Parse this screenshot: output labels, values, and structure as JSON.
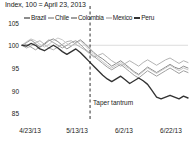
{
  "chart_data": {
    "type": "line",
    "title": "Index, 100 = April 23, 2013",
    "xlabel": "",
    "ylabel": "",
    "ylim": [
      84,
      106
    ],
    "yticks": [
      105,
      100,
      95,
      90,
      85
    ],
    "xticks": [
      "4/23/13",
      "5/13/13",
      "6/2/13",
      "6/22/13"
    ],
    "xlim": [
      "4/23/13",
      "7/2/13"
    ],
    "grid": "horizontal-single-at-100",
    "legend_position": "top",
    "annotations": [
      {
        "label": "Taper tantrum",
        "x": "5/22/13",
        "style": "dashed-vertical-line"
      }
    ],
    "series": [
      {
        "name": "Brazil",
        "color": "#8c8c8c",
        "values": [
          100.0,
          100.6,
          101.2,
          100.4,
          99.6,
          100.2,
          101.0,
          101.4,
          100.8,
          100.0,
          99.2,
          99.8,
          100.6,
          101.2,
          100.4,
          99.4,
          98.4,
          97.6,
          97.0,
          96.2,
          95.4,
          96.0,
          96.6,
          95.8,
          95.0,
          94.2,
          93.6,
          94.4,
          95.2,
          94.6,
          94.0,
          94.6,
          95.2,
          95.8,
          95.2,
          94.8,
          95.4,
          95.0
        ]
      },
      {
        "name": "Chile",
        "color": "#b3b3b3",
        "values": [
          100.0,
          99.4,
          99.8,
          100.6,
          101.0,
          100.2,
          99.4,
          99.0,
          99.6,
          100.2,
          100.8,
          101.0,
          100.2,
          99.6,
          99.0,
          98.2,
          97.4,
          97.8,
          98.2,
          97.4,
          96.6,
          96.0,
          95.4,
          96.0,
          96.6,
          96.0,
          95.4,
          96.2,
          96.8,
          96.2,
          95.6,
          96.2,
          96.8,
          97.2,
          96.6,
          96.0,
          96.6,
          96.2
        ]
      },
      {
        "name": "Colombia",
        "color": "#a0a0a0",
        "values": [
          100.0,
          100.2,
          99.6,
          99.0,
          99.6,
          100.4,
          101.2,
          100.6,
          100.0,
          99.4,
          100.0,
          100.6,
          101.0,
          100.2,
          99.2,
          98.4,
          97.6,
          96.8,
          96.0,
          95.2,
          94.6,
          95.2,
          95.8,
          95.0,
          94.2,
          93.4,
          92.8,
          93.6,
          94.4,
          93.8,
          93.2,
          93.8,
          94.4,
          95.0,
          94.4,
          93.8,
          94.4,
          94.0
        ]
      },
      {
        "name": "Mexico",
        "color": "#c8c8c8",
        "values": [
          100.0,
          100.8,
          101.4,
          101.0,
          100.2,
          99.6,
          100.2,
          101.0,
          101.6,
          101.2,
          100.4,
          99.8,
          100.4,
          101.0,
          100.0,
          99.0,
          98.0,
          97.2,
          96.4,
          95.6,
          95.0,
          95.6,
          96.2,
          95.4,
          94.8,
          94.0,
          93.4,
          94.2,
          95.0,
          94.4,
          93.8,
          94.4,
          95.0,
          95.6,
          95.0,
          94.4,
          95.0,
          94.6
        ]
      },
      {
        "name": "Peru",
        "color": "#333333",
        "values": [
          100.0,
          99.8,
          100.4,
          100.0,
          99.2,
          98.8,
          99.4,
          100.0,
          99.4,
          98.6,
          98.0,
          98.6,
          99.2,
          98.4,
          97.4,
          96.4,
          95.4,
          94.4,
          93.4,
          92.6,
          92.0,
          92.6,
          93.2,
          92.4,
          91.6,
          92.2,
          92.8,
          92.2,
          91.4,
          90.0,
          88.6,
          88.2,
          88.6,
          89.0,
          88.6,
          88.2,
          88.8,
          88.4
        ]
      }
    ]
  },
  "legend": {
    "items": [
      {
        "label": "Brazil"
      },
      {
        "label": "Chile"
      },
      {
        "label": "Colombia"
      },
      {
        "label": "Mexico"
      },
      {
        "label": "Peru"
      }
    ]
  }
}
